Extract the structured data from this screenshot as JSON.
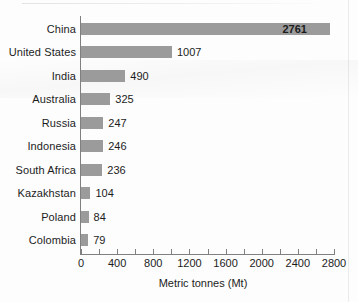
{
  "chart_data": {
    "type": "bar",
    "orientation": "horizontal",
    "title": "",
    "xlabel": "Metric tonnes (Mt)",
    "ylabel": "",
    "categories": [
      "China",
      "United States",
      "India",
      "Australia",
      "Russia",
      "Indonesia",
      "South Africa",
      "Kazakhstan",
      "Poland",
      "Colombia"
    ],
    "values": [
      2761,
      1007,
      490,
      325,
      247,
      246,
      236,
      104,
      84,
      79
    ],
    "value_labels": [
      "2761",
      "1007",
      "490",
      "325",
      "247",
      "246",
      "236",
      "104",
      "84",
      "79"
    ],
    "label_placement": [
      "inside",
      "outside",
      "outside",
      "outside",
      "outside",
      "outside",
      "outside",
      "outside",
      "outside",
      "outside"
    ],
    "xlim": [
      0,
      2800
    ],
    "xticks": [
      0,
      400,
      800,
      1200,
      1600,
      2000,
      2400,
      2800
    ],
    "xtick_labels": [
      "0",
      "400",
      "800",
      "1200",
      "1600",
      "2000",
      "2400",
      "2800"
    ],
    "minor_tick_step": 200,
    "grid": false,
    "legend": null,
    "bar_color": "#9b9b9b",
    "axis_color": "#808080",
    "text_color": "#1c1c1c",
    "background": "#fdfdfd"
  }
}
